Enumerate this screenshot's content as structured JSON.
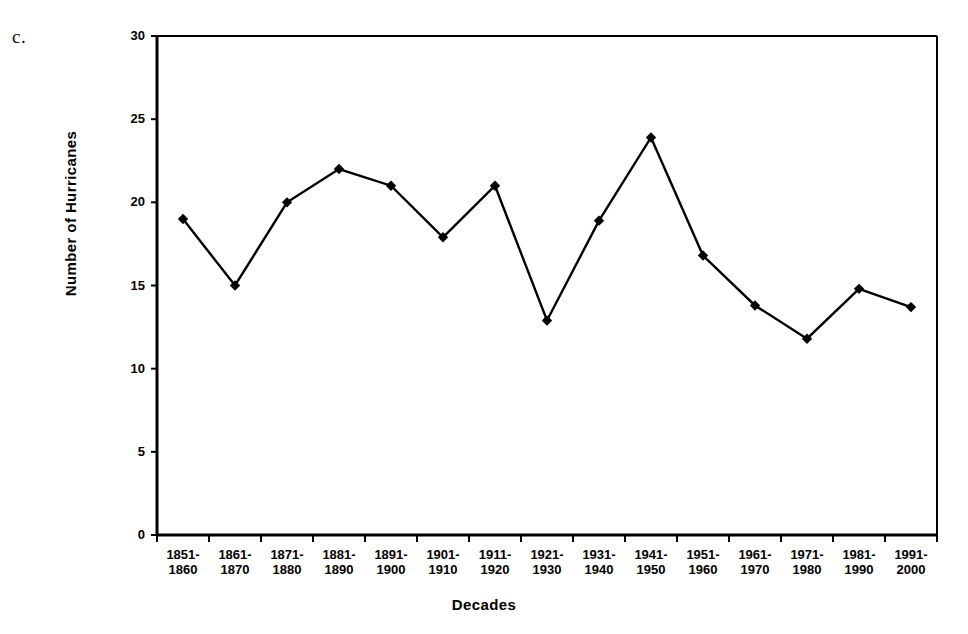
{
  "figure": {
    "panel_letter": "c.",
    "marker_color": "#000000",
    "line_color": "#000000",
    "axis_color": "#000000",
    "background": "#ffffff"
  },
  "chart_data": {
    "type": "line",
    "title": "",
    "xlabel": "Decades",
    "ylabel": "Number of Hurricanes",
    "categories": [
      "1851-1860",
      "1861-1870",
      "1871-1880",
      "1881-1890",
      "1891-1900",
      "1901-1910",
      "1911-1920",
      "1921-1930",
      "1931-1940",
      "1941-1950",
      "1951-1960",
      "1961-1970",
      "1971-1980",
      "1981-1990",
      "1991-2000"
    ],
    "category_lines": [
      [
        "1851-",
        "1860"
      ],
      [
        "1861-",
        "1870"
      ],
      [
        "1871-",
        "1880"
      ],
      [
        "1881-",
        "1890"
      ],
      [
        "1891-",
        "1900"
      ],
      [
        "1901-",
        "1910"
      ],
      [
        "1911-",
        "1920"
      ],
      [
        "1921-",
        "1930"
      ],
      [
        "1931-",
        "1940"
      ],
      [
        "1941-",
        "1950"
      ],
      [
        "1951-",
        "1960"
      ],
      [
        "1961-",
        "1970"
      ],
      [
        "1971-",
        "1980"
      ],
      [
        "1981-",
        "1990"
      ],
      [
        "1991-",
        "2000"
      ]
    ],
    "values": [
      19,
      15,
      20,
      22,
      21,
      17.9,
      21,
      12.9,
      18.9,
      23.9,
      16.8,
      13.8,
      11.8,
      14.8,
      13.7
    ],
    "ylim": [
      0,
      30
    ],
    "yticks": [
      0,
      5,
      10,
      15,
      20,
      25,
      30
    ],
    "ytick_labels": [
      "0",
      "5",
      "10",
      "15",
      "20",
      "25",
      "30"
    ],
    "grid": false,
    "legend": false,
    "marker": "diamond",
    "series": [
      {
        "name": "Number of Hurricanes",
        "values": [
          19,
          15,
          20,
          22,
          21,
          17.9,
          21,
          12.9,
          18.9,
          23.9,
          16.8,
          13.8,
          11.8,
          14.8,
          13.7
        ]
      }
    ]
  }
}
